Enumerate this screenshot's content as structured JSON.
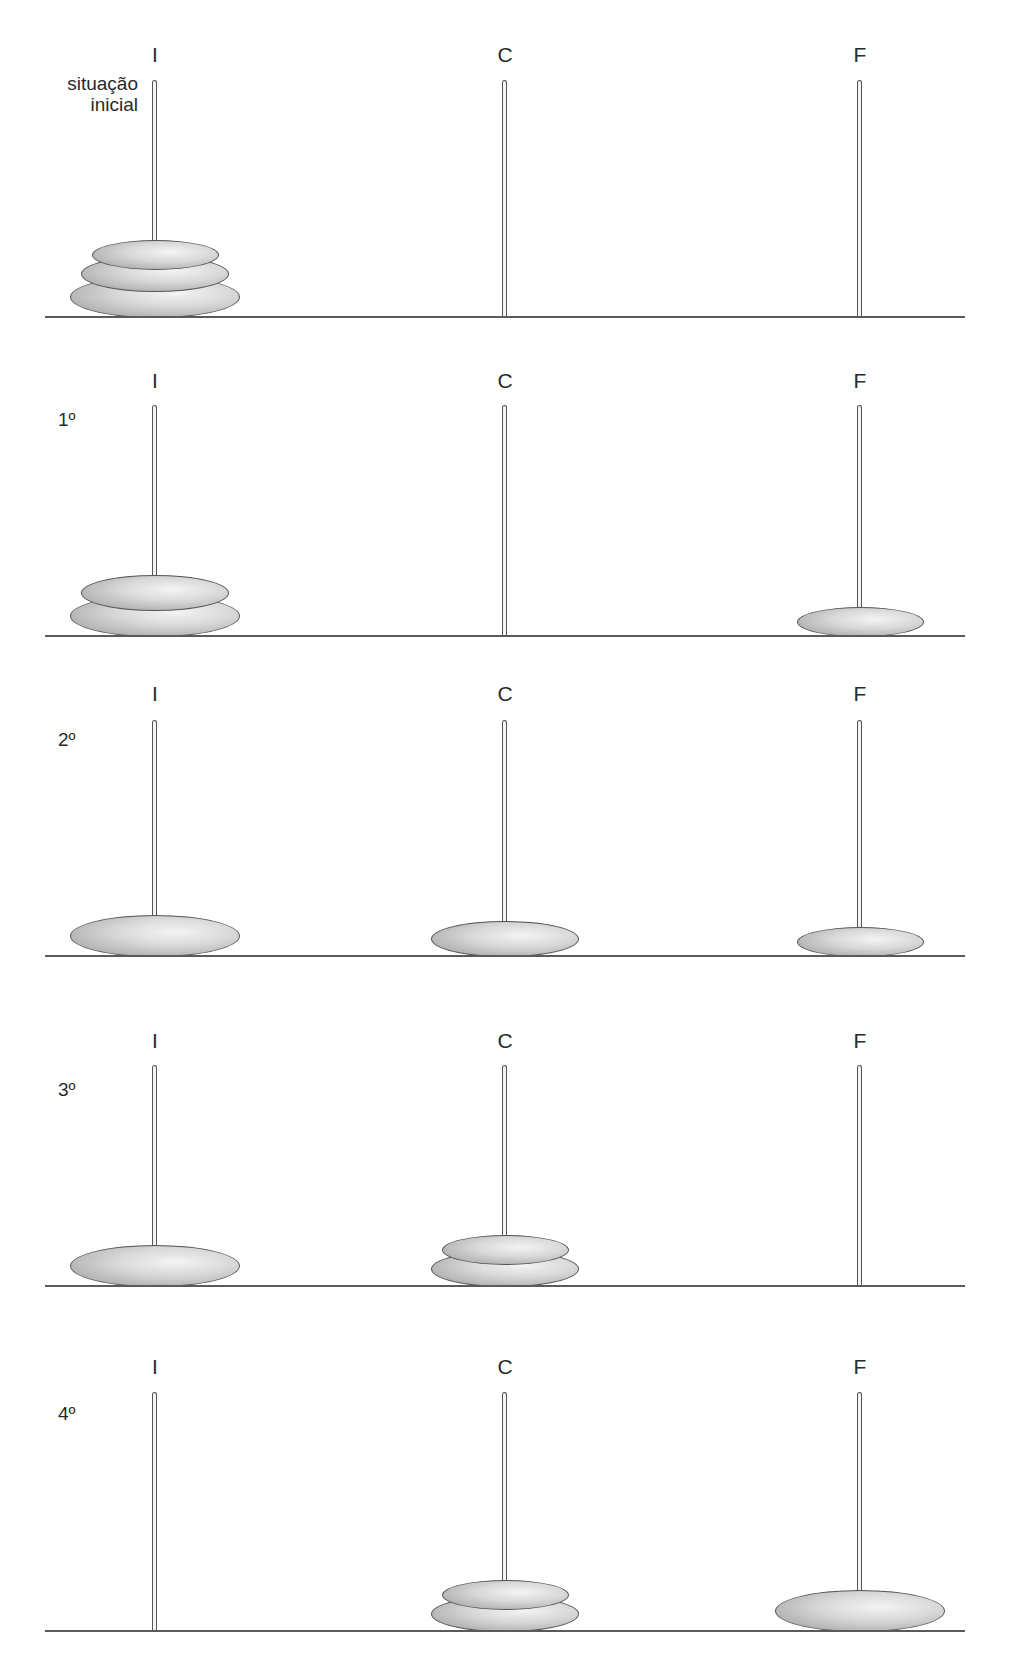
{
  "figure": {
    "peg_labels": [
      "I",
      "C",
      "F"
    ],
    "colors": {
      "disk_fill": "#c8c8c8",
      "disk_outline": "#555555",
      "pole": "#555555",
      "baseline": "#5a5a5a"
    },
    "disk_sizes": {
      "large": [
        170,
        42
      ],
      "medium": [
        148,
        36
      ],
      "small": [
        127,
        30
      ]
    }
  },
  "panels": [
    {
      "label": "situação inicial",
      "label_lines": [
        "situação",
        "inicial"
      ],
      "pegs": {
        "I": [
          "large",
          "medium",
          "small"
        ],
        "C": [],
        "F": []
      }
    },
    {
      "label": "1º",
      "pegs": {
        "I": [
          "large",
          "medium"
        ],
        "C": [],
        "F": [
          "small"
        ]
      }
    },
    {
      "label": "2º",
      "pegs": {
        "I": [
          "large"
        ],
        "C": [
          "medium"
        ],
        "F": [
          "small"
        ]
      }
    },
    {
      "label": "3º",
      "pegs": {
        "I": [
          "large"
        ],
        "C": [
          "medium",
          "small"
        ],
        "F": []
      }
    },
    {
      "label": "4º",
      "pegs": {
        "I": [],
        "C": [
          "medium",
          "small"
        ],
        "F": [
          "large"
        ]
      }
    }
  ]
}
